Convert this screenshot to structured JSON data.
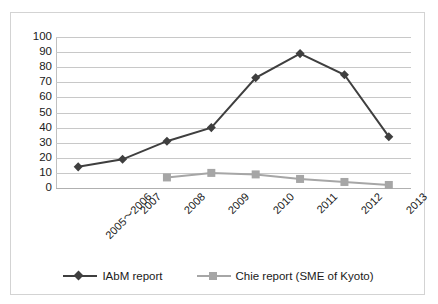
{
  "chart_data": {
    "type": "line",
    "title": "",
    "xlabel": "",
    "ylabel": "",
    "ylim": [
      0,
      100
    ],
    "ytick_step": 10,
    "yticks": [
      100,
      90,
      80,
      70,
      60,
      50,
      40,
      30,
      20,
      10,
      0
    ],
    "grid": true,
    "legend_position": "bottom-center",
    "categories": [
      "2005〜2006",
      "2007",
      "2008",
      "2009",
      "2010",
      "2011",
      "2012",
      "2013"
    ],
    "series": [
      {
        "name": "IAbM report",
        "color": "#3f3f3f",
        "marker": "diamond",
        "values": [
          14,
          19,
          31,
          40,
          73,
          89,
          75,
          34
        ]
      },
      {
        "name": "Chie report  (SME of Kyoto)",
        "color": "#a6a6a6",
        "marker": "square",
        "values": [
          null,
          null,
          7,
          10,
          9,
          6,
          4,
          2
        ]
      }
    ]
  },
  "legend": {
    "items": [
      {
        "label": "IAbM report"
      },
      {
        "label": "Chie report  (SME of Kyoto)"
      }
    ]
  }
}
